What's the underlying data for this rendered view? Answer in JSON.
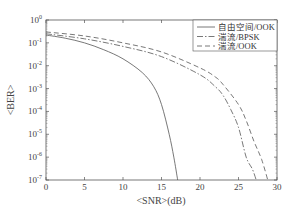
{
  "chart_data": {
    "type": "line",
    "title": "",
    "xlabel": "<SNR>(dB)",
    "ylabel": "<BER>",
    "xlim": [
      0,
      30
    ],
    "ylim": [
      1e-07,
      1
    ],
    "yscale": "log",
    "grid": false,
    "legend_position": "upper right",
    "x_ticks": [
      0,
      5,
      10,
      15,
      20,
      25,
      30
    ],
    "y_ticks": [
      {
        "value": 1,
        "label": "10^0"
      },
      {
        "value": 0.1,
        "label": "10^-1"
      },
      {
        "value": 0.01,
        "label": "10^-2"
      },
      {
        "value": 0.001,
        "label": "10^-3"
      },
      {
        "value": 0.0001,
        "label": "10^-4"
      },
      {
        "value": 1e-05,
        "label": "10^-5"
      },
      {
        "value": 1e-06,
        "label": "10^-6"
      },
      {
        "value": 1e-07,
        "label": "10^-7"
      }
    ],
    "series": [
      {
        "name": "自由空间/OOK",
        "style": "solid",
        "x": [
          0,
          2.5,
          5,
          7.5,
          10,
          12.5,
          14,
          15,
          16,
          16.6,
          17.1
        ],
        "y": [
          0.22,
          0.16,
          0.1,
          0.05,
          0.02,
          0.005,
          0.0012,
          0.0002,
          1e-05,
          1e-06,
          1e-07
        ]
      },
      {
        "name": "湍流/BPSK",
        "style": "dash-dot",
        "x": [
          0,
          5,
          10,
          15,
          20,
          22,
          23,
          24,
          25,
          26,
          26.8,
          27.3
        ],
        "y": [
          0.25,
          0.15,
          0.07,
          0.025,
          0.004,
          0.0012,
          0.0005,
          0.00012,
          2e-05,
          1e-06,
          3e-07,
          1e-07
        ]
      },
      {
        "name": "湍流/OOK",
        "style": "dashed",
        "x": [
          0,
          5,
          10,
          15,
          20,
          22,
          23,
          25,
          26,
          27,
          28,
          28.8
        ],
        "y": [
          0.3,
          0.2,
          0.1,
          0.04,
          0.008,
          0.0032,
          0.0015,
          0.0002,
          4e-05,
          5e-06,
          8e-07,
          1e-07
        ]
      }
    ]
  },
  "axes": {
    "x_tick_labels": [
      "0",
      "5",
      "10",
      "15",
      "20",
      "25",
      "30"
    ],
    "y_tick_exponents": [
      "0",
      "-1",
      "-2",
      "-3",
      "-4",
      "-5",
      "-6",
      "-7"
    ],
    "y_tick_base": "10",
    "xlabel": "<SNR>(dB)",
    "ylabel": "<BER>"
  },
  "legend": {
    "items": [
      {
        "label": "自由空间/OOK",
        "style": "solid"
      },
      {
        "label": "湍流/BPSK",
        "style": "dash-dot"
      },
      {
        "label": "湍流/OOK",
        "style": "dashed"
      }
    ]
  },
  "colors": {
    "line": "#555555",
    "axis": "#555555",
    "text": "#444444",
    "background": "#ffffff"
  }
}
